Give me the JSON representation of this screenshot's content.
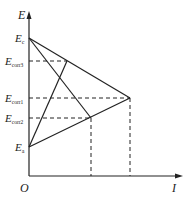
{
  "diagram": {
    "type": "evans-diagram",
    "axes": {
      "y_label": "E",
      "x_label": "I",
      "origin_label": "O"
    },
    "potential_labels": [
      {
        "id": "Ec",
        "main": "E",
        "sub": "c",
        "y": 38
      },
      {
        "id": "Ecorr3",
        "main": "E",
        "sub": "corr3",
        "y": 61
      },
      {
        "id": "Ecorr1",
        "main": "E",
        "sub": "corr1",
        "y": 98
      },
      {
        "id": "Ecorr2",
        "main": "E",
        "sub": "corr2",
        "y": 118
      },
      {
        "id": "Ea",
        "main": "E",
        "sub": "a",
        "y": 147
      }
    ],
    "lines": [
      {
        "name": "cathodic-line-1",
        "from": [
          29,
          38
        ],
        "to": [
          130,
          98
        ],
        "style": "solid"
      },
      {
        "name": "anodic-line-1",
        "from": [
          29,
          147
        ],
        "to": [
          130,
          98
        ],
        "style": "solid"
      },
      {
        "name": "cathodic-line-2",
        "from": [
          29,
          38
        ],
        "to": [
          91,
          118
        ],
        "style": "solid"
      },
      {
        "name": "anodic-line-2",
        "from": [
          29,
          147
        ],
        "to": [
          67,
          61
        ],
        "style": "solid"
      }
    ],
    "guides": [
      {
        "name": "ecorr3-guide",
        "from": [
          29,
          61
        ],
        "to": [
          67,
          61
        ]
      },
      {
        "name": "ecorr1-guide",
        "from": [
          29,
          98
        ],
        "to": [
          130,
          98
        ]
      },
      {
        "name": "ecorr2-guide",
        "from": [
          29,
          118
        ],
        "to": [
          91,
          118
        ]
      },
      {
        "name": "icorr2-guide",
        "from": [
          91,
          118
        ],
        "to": [
          91,
          176
        ]
      },
      {
        "name": "icorr1-guide",
        "from": [
          130,
          98
        ],
        "to": [
          130,
          176
        ]
      }
    ],
    "colors": {
      "ink": "#222222",
      "background": "#ffffff"
    }
  }
}
